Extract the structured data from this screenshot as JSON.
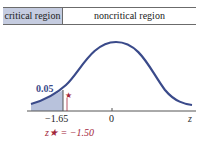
{
  "header": {
    "critical_label": "critical region",
    "noncritical_label": "noncritical region"
  },
  "plot": {
    "tail_area_label": "0.05",
    "critical_value_label": "−1.65",
    "zero_label": "0",
    "axis_label": "z",
    "test_stat_label": "z★ = −1.50"
  },
  "colors": {
    "curve": "#3a4a8a",
    "shade": "#b8c2dc",
    "accent": "#a3263a",
    "header_fill": "#c5cce0"
  }
}
